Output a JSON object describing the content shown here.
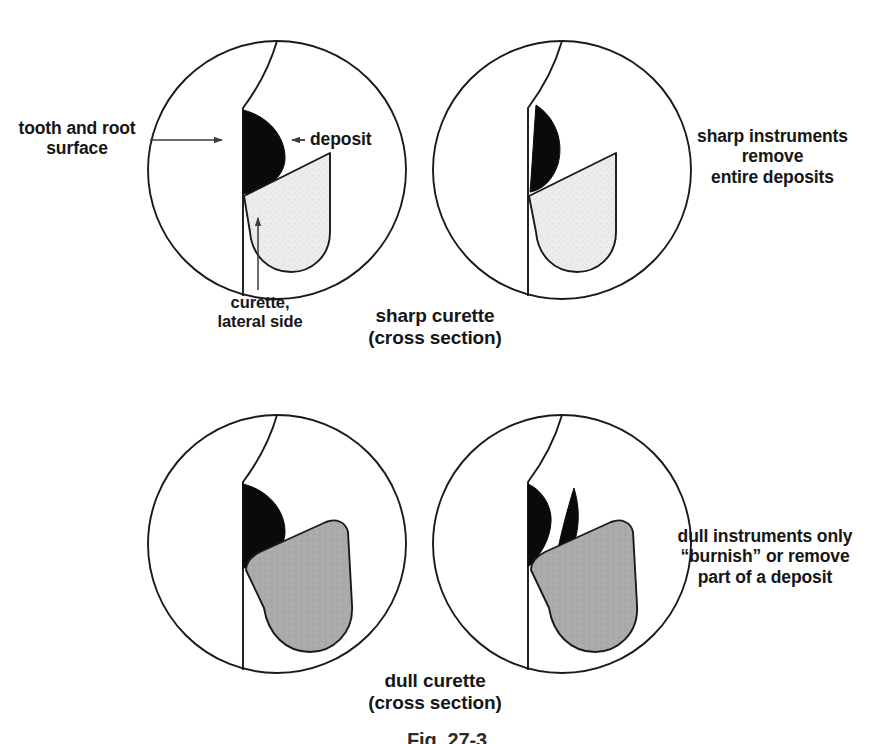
{
  "figure": {
    "number": "Fig. 27-3",
    "background_color": "#ffffff",
    "line_color": "#1a1a1a",
    "deposit_color": "#0a0a0a",
    "sharp_curette_fill": "#ebebeb",
    "dull_curette_fill": "#a9a9a9"
  },
  "labels": {
    "tooth_surface": "tooth and root\nsurface",
    "deposit": "deposit",
    "curette_lateral": "curette,\nlateral side"
  },
  "captions": {
    "sharp": "sharp curette\n(cross section)",
    "dull": "dull curette\n(cross section)"
  },
  "notes": {
    "sharp": "sharp instruments\nremove\nentire deposits",
    "dull": "dull instruments only\n“burnish” or remove\npart of a deposit"
  },
  "panels": [
    {
      "id": "sharp-before",
      "row": "top",
      "column": "left",
      "description": "sharp curette blade engaging an intact deposit on the tooth and root surface"
    },
    {
      "id": "sharp-after",
      "row": "top",
      "column": "right",
      "description": "sharp curette lifting the entire deposit away from the root surface"
    },
    {
      "id": "dull-before",
      "row": "bottom",
      "column": "left",
      "description": "dull rounded curette blade pressed against an intact deposit"
    },
    {
      "id": "dull-after",
      "row": "bottom",
      "column": "right",
      "description": "dull curette burnishing the deposit, removing only a sliver and leaving part behind"
    }
  ]
}
